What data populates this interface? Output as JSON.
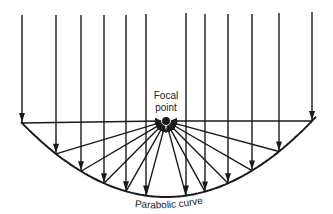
{
  "diagram": {
    "labels": {
      "focal_line1": "Focal",
      "focal_line2": "point",
      "curve": "Parabolic curve"
    },
    "colors": {
      "stroke": "#1a1a1a",
      "background": "#ffffff"
    },
    "focal_point": {
      "x": 166,
      "y": 121
    },
    "parabola": {
      "vertex_x": 166,
      "vertex_y": 197,
      "k": 0.003567,
      "x_start": 21,
      "x_end": 316
    },
    "incoming_rays": [
      {
        "x": 22,
        "top": 15
      },
      {
        "x": 56,
        "top": 15
      },
      {
        "x": 81,
        "top": 15
      },
      {
        "x": 104,
        "top": 15
      },
      {
        "x": 126,
        "top": 15
      },
      {
        "x": 146,
        "top": 14
      },
      {
        "x": 186,
        "top": 13
      },
      {
        "x": 205,
        "top": 14
      },
      {
        "x": 228,
        "top": 14
      },
      {
        "x": 252,
        "top": 14
      },
      {
        "x": 279,
        "top": 13
      },
      {
        "x": 312,
        "top": 12
      }
    ]
  }
}
